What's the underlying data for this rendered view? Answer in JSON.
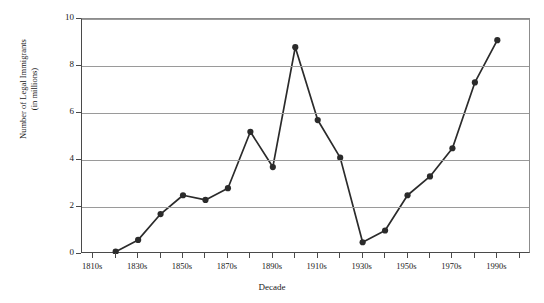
{
  "figure": {
    "ghost_header": "",
    "x_axis_title": "Decade",
    "y_axis_title_line1": "Number of Legal Immigrants",
    "y_axis_title_line2": "(in millions)"
  },
  "chart_data": {
    "type": "line",
    "title": "",
    "xlabel": "Decade",
    "ylabel": "Number of Legal Immigrants (in millions)",
    "ylim": [
      0,
      10
    ],
    "yticks": [
      0,
      2,
      4,
      6,
      8,
      10
    ],
    "ytick_labels": [
      "0",
      "2",
      "4",
      "6",
      "8",
      "10"
    ],
    "grid": true,
    "legend": "none",
    "marker": "filled-circle",
    "line_color": "#2b2b2b",
    "marker_color": "#2b2b2b",
    "grid_color": "#9a9a9a",
    "axis_color": "#4a4a4a",
    "xtick_labels": [
      "1810s",
      "1830s",
      "1850s",
      "1870s",
      "1890s",
      "1910s",
      "1930s",
      "1950s",
      "1970s",
      "1990s"
    ],
    "x_all_decades": [
      "1810s",
      "1820s",
      "1830s",
      "1840s",
      "1850s",
      "1860s",
      "1870s",
      "1880s",
      "1890s",
      "1900s",
      "1910s",
      "1920s",
      "1930s",
      "1940s",
      "1950s",
      "1960s",
      "1970s",
      "1980s",
      "1990s",
      "2000s"
    ],
    "categories": [
      "1820s",
      "1830s",
      "1840s",
      "1850s",
      "1860s",
      "1870s",
      "1880s",
      "1890s",
      "1900s",
      "1910s",
      "1920s",
      "1930s",
      "1940s",
      "1950s",
      "1960s",
      "1970s",
      "1980s",
      "1990s"
    ],
    "values": [
      0.1,
      0.6,
      1.7,
      2.5,
      2.3,
      2.8,
      5.2,
      3.7,
      8.8,
      5.7,
      4.1,
      0.5,
      1.0,
      2.5,
      3.3,
      4.5,
      7.3,
      9.1
    ]
  }
}
